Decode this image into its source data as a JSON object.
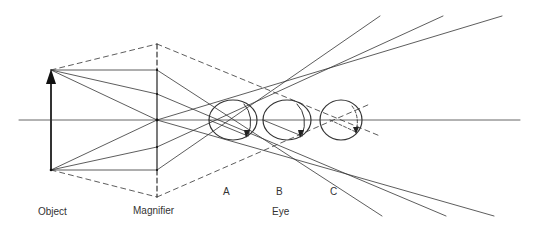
{
  "diagram": {
    "labels": {
      "object": "Object",
      "magnifier": "Magnifier",
      "eye": "Eye",
      "eye_a": "A",
      "eye_b": "B",
      "eye_c": "C"
    },
    "colors": {
      "line": "#333333",
      "background": "#ffffff"
    },
    "elements": [
      "optical-axis",
      "object-arrow",
      "magnifier-lens",
      "eye-a",
      "eye-b",
      "eye-c",
      "parallel-rays-up",
      "parallel-rays-down",
      "dashed-construction-lines"
    ]
  }
}
